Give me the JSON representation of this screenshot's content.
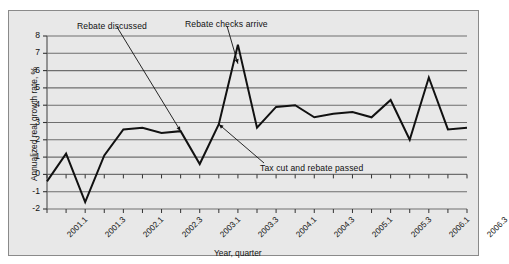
{
  "figure": {
    "background_color": "#e8e8e8",
    "border_color": "#8a8a8a",
    "line_color": "#111111",
    "gridline_color": "#6e6e6e",
    "annotation_color": "#111111"
  },
  "annotations": {
    "rebate_discussed": "Rebate discussed",
    "rebate_checks_arrive": "Rebate checks arrive",
    "tax_cut_and_rebate_passed": "Tax cut and rebate passed"
  },
  "axis": {
    "ylabel": "Annualized real growth rate, %",
    "xlabel": "Year, quarter",
    "yticks": [
      "8",
      "7",
      "6",
      "5",
      "4",
      "3",
      "2",
      "1",
      "0",
      "-1",
      "-2"
    ],
    "xticks": [
      "2001.1",
      "2001.3",
      "2002.1",
      "2002.3",
      "2003.1",
      "2003.3",
      "2004.1",
      "2004.3",
      "2005.1",
      "2005.3",
      "2006.1",
      "2006.3"
    ]
  },
  "chart_data": {
    "type": "line",
    "title": "",
    "xlabel": "Year, quarter",
    "ylabel": "Annualized real growth rate, %",
    "ylim": [
      -2,
      8
    ],
    "ytick_values": [
      -2,
      -1,
      0,
      1,
      2,
      3,
      4,
      5,
      6,
      7,
      8
    ],
    "grid": true,
    "legend": "none",
    "categories": [
      "2001.1",
      "2001.2",
      "2001.3",
      "2001.4",
      "2002.1",
      "2002.2",
      "2002.3",
      "2002.4",
      "2003.1",
      "2003.2",
      "2003.3",
      "2003.4",
      "2004.1",
      "2004.2",
      "2004.3",
      "2004.4",
      "2005.1",
      "2005.2",
      "2005.3",
      "2005.4",
      "2006.1",
      "2006.2",
      "2006.3"
    ],
    "values": [
      -0.4,
      1.2,
      -1.6,
      1.1,
      2.6,
      2.7,
      2.4,
      2.5,
      0.6,
      2.9,
      7.5,
      2.7,
      3.9,
      4.0,
      3.3,
      3.5,
      3.6,
      3.3,
      4.3,
      2.0,
      5.6,
      2.6,
      2.7
    ],
    "annotations": [
      {
        "text": "Rebate discussed",
        "points_to_category": "2002.4",
        "points_to_value": 2.5
      },
      {
        "text": "Rebate checks arrive",
        "points_to_category": "2003.3",
        "points_to_value": 6.4
      },
      {
        "text": "Tax cut and rebate passed",
        "points_to_category": "2003.2",
        "points_to_value": 2.9
      }
    ]
  }
}
